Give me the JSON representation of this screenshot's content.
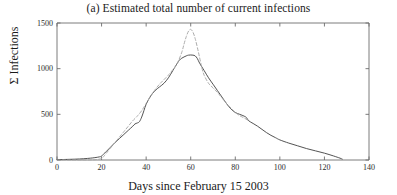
{
  "chart_data": {
    "type": "line",
    "title": "(a) Estimated total number of current infections",
    "xlabel": "Days since February 15 2003",
    "ylabel": "Σ Infections",
    "xlim": [
      0,
      140
    ],
    "ylim": [
      0,
      1500
    ],
    "xticks": [
      0,
      20,
      40,
      60,
      80,
      100,
      120,
      140
    ],
    "xtick_labels": [
      "0",
      "20",
      "40",
      "60",
      "80",
      "100",
      "120",
      "140"
    ],
    "yticks": [
      0,
      500,
      1000,
      1500
    ],
    "ytick_labels": [
      "0",
      "500",
      "1000",
      "1500"
    ],
    "grid": false,
    "legend": "none",
    "series": [
      {
        "name": "solid",
        "style": "solid",
        "color": "#4a4a4a",
        "x": [
          0,
          4,
          8,
          12,
          15,
          17,
          19,
          20,
          22,
          24,
          26,
          28,
          30,
          32,
          34,
          35,
          36,
          37,
          38,
          39,
          40,
          42,
          44,
          46,
          48,
          50,
          52,
          54,
          55,
          56,
          58,
          59,
          60,
          61,
          62,
          63,
          64,
          66,
          68,
          70,
          72,
          74,
          76,
          78,
          80,
          82,
          84,
          85,
          86,
          88,
          90,
          92,
          94,
          96,
          98,
          100,
          104,
          108,
          112,
          116,
          120,
          124,
          127,
          128
        ],
        "y": [
          4,
          6,
          9,
          14,
          20,
          26,
          34,
          44,
          90,
          140,
          190,
          235,
          280,
          325,
          370,
          395,
          405,
          420,
          470,
          540,
          610,
          700,
          760,
          800,
          840,
          900,
          980,
          1060,
          1095,
          1115,
          1140,
          1148,
          1150,
          1148,
          1140,
          1110,
          1060,
          980,
          900,
          830,
          760,
          690,
          620,
          560,
          520,
          500,
          480,
          465,
          430,
          400,
          370,
          335,
          300,
          270,
          245,
          220,
          185,
          155,
          125,
          100,
          75,
          45,
          20,
          10
        ]
      },
      {
        "name": "dashed",
        "style": "dashed",
        "color": "#a8a8a8",
        "x": [
          0,
          6,
          12,
          16,
          18,
          20,
          21,
          22,
          24,
          26,
          28,
          30,
          32,
          34,
          36,
          38,
          40,
          42,
          44,
          46,
          48,
          50,
          52,
          54,
          56,
          57,
          58,
          59,
          60,
          61,
          62,
          63,
          64,
          65,
          66,
          68,
          70,
          72,
          74,
          76,
          78,
          80,
          82,
          84,
          86
        ],
        "y": [
          0,
          0,
          0,
          2,
          6,
          16,
          40,
          70,
          130,
          190,
          250,
          310,
          370,
          430,
          480,
          540,
          620,
          700,
          770,
          830,
          880,
          930,
          990,
          1060,
          1180,
          1270,
          1350,
          1410,
          1430,
          1400,
          1330,
          1230,
          1120,
          1010,
          930,
          840,
          790,
          740,
          680,
          620,
          570,
          520,
          485,
          460,
          430
        ]
      }
    ]
  }
}
